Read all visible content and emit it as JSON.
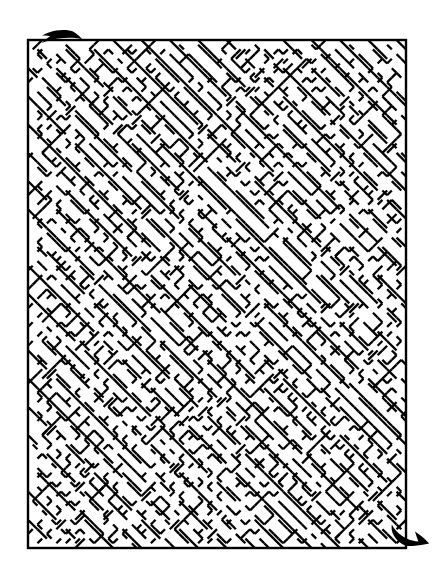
{
  "figure": {
    "title": "Diagonal lattice maze puzzle",
    "type": "maze",
    "width": 443,
    "height": 586
  },
  "colors": {
    "background": "#ffffff",
    "wall": "#000000",
    "arrow": "#000000"
  },
  "maze": {
    "border": {
      "x": 28,
      "y": 40,
      "width": 378,
      "height": 508,
      "stroke_width": 2.4
    },
    "lattice": {
      "cell": 9.45,
      "cols": 40,
      "rows": 54,
      "style": "diagonal",
      "wall_stroke_width": 2.3,
      "seed": 20240917
    },
    "entrance": {
      "label": "entrance-arrow",
      "position": "bottom-right",
      "direction": "up-right"
    },
    "exit": {
      "label": "exit-arrow",
      "position": "top-left",
      "direction": "up-left"
    }
  },
  "arrows": {
    "exit": {
      "name": "exit-arrow",
      "path": "M 72.5 31.2 C 66.0 29.4 57.0 29.6 49.5 32.2 C 46.8 33.1 44.2 34.3 41.8 35.8 C 44.6 35.4 47.6 35.5 50.3 36.2 C 48.2 37.4 46.1 38.9 44.0 40.7 C 43.1 41.5 42.3 42.3 41.6 43.1 C 47.0 41.0 52.6 39.5 58.2 38.6 C 63.3 37.8 68.2 37.5 72.5 37.8 C 76.6 38.0 79.9 38.6 82.2 39.3 C 79.8 36.3 76.5 33.2 72.5 31.2 Z"
    },
    "entrance": {
      "name": "entrance-arrow",
      "path": "M 406.0 546.0 C 400.5 543.5 396.0 540.0 393.5 535.0 C 391.8 531.6 391.2 528.0 391.8 524.4 C 394.2 528.8 397.3 532.4 401.1 535.2 C 404.6 537.8 408.5 539.6 412.4 540.6 C 414.6 541.2 416.6 541.5 418.4 541.6 C 417.2 538.6 416.0 535.2 415.0 531.6 C 420.8 535.4 425.6 539.4 429.2 543.6 C 424.2 544.8 418.6 545.5 412.6 545.9 C 410.4 546.0 408.2 546.1 406.0 546.0 Z"
    }
  },
  "a11y": {
    "figure_description": "A rectangular maze drawn with black diagonal wall segments on a white background, with a curved arrow at the upper-left marking the exit and a curved arrow at the lower-right marking the entrance."
  }
}
